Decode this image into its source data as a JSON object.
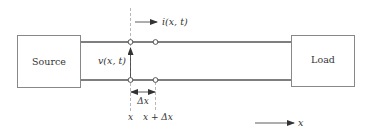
{
  "diagram": {
    "type": "transmission-line-segment",
    "source_label": "Source",
    "load_label": "Load",
    "current_label": "i(x, t)",
    "voltage_label": "v(x, t)",
    "delta_label": "Δx",
    "position_x_label": "x",
    "position_x_plus_dx_label": "x + Δx",
    "axis_label": "x",
    "colors": {
      "line": "#555555",
      "box_border": "#888888",
      "text": "#333333"
    }
  }
}
